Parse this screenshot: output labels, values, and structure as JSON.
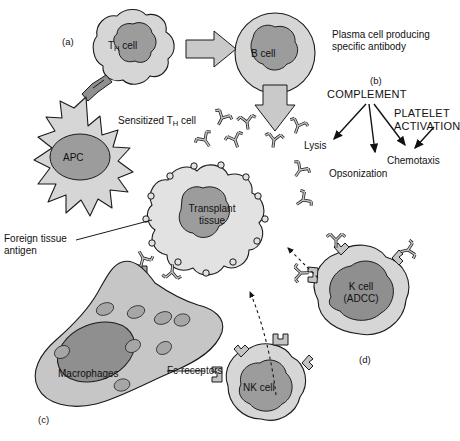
{
  "figure": {
    "background_color": "#ffffff",
    "palette": {
      "cytoplasm": "#d6d6d6",
      "nucleus": "#9c9c9c",
      "nucleus_dark": "#8f8f8f",
      "outline": "#1a1a1a",
      "arrow_block_fill": "#c9c9c9",
      "antibody_fill": "#c4c4c4",
      "text": "#111111"
    }
  },
  "panel_labels": {
    "a": "(a)",
    "b": "(b)",
    "c": "(c)",
    "d": "(d)"
  },
  "cells": {
    "th_cell": {
      "label": "T",
      "label_sub": "H",
      "label_tail": " cell"
    },
    "b_cell": {
      "label": "B cell"
    },
    "apc": {
      "label": "APC"
    },
    "transplant": {
      "label_line1": "Transplant",
      "label_line2": "tissue"
    },
    "macrophages": {
      "label": "Macrophages"
    },
    "nk_cell": {
      "label": "NK cell"
    },
    "k_cell": {
      "label_line1": "K cell",
      "label_line2": "(ADCC)"
    }
  },
  "annotations": {
    "sensitized": {
      "pre": "Sensitized T",
      "sub": "H",
      "post": " cell"
    },
    "plasma_cell": {
      "line1": "Plasma cell producing",
      "line2": "specific antibody"
    },
    "foreign_antigen": {
      "line1": "Foreign tissue",
      "line2": "antigen"
    },
    "fc_receptors": "Fc receptors"
  },
  "complement_cascade": {
    "source": "COMPLEMENT",
    "secondary_source": {
      "line1": "PLATELET",
      "line2": "ACTIVATION"
    },
    "outcomes": [
      "Lysis",
      "Opsonization",
      "Chemotaxis"
    ]
  }
}
